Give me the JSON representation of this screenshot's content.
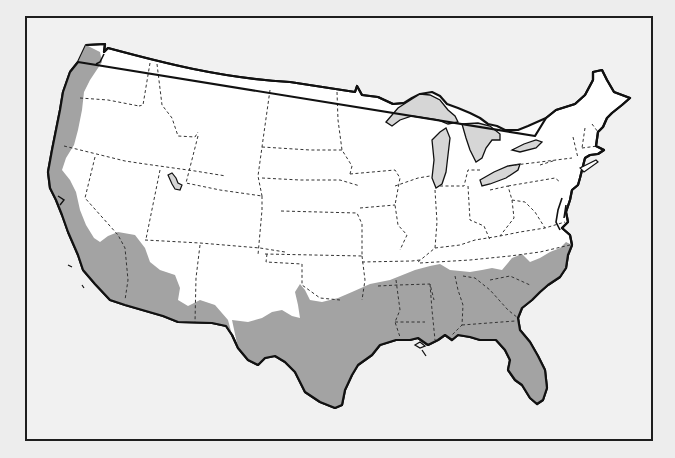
{
  "map": {
    "title": "Contiguous United States with shaded southern and Pacific coastal region",
    "region_label": "Shaded region",
    "colors": {
      "background": "#ededed",
      "frame_fill": "#f1f1f1",
      "frame_border": "#1e1e1e",
      "land": "#ffffff",
      "shaded_region": "#a3a3a3",
      "lakes": "#d6d6d6",
      "coastline": "#111111",
      "state_borders": "#333333"
    },
    "features": [
      "Pacific coast shaded band (Washington, Oregon, California)",
      "Southwest shaded area (southern Arizona)",
      "Southern shaded band (Texas, Louisiana, Mississippi, Alabama, Georgia, Florida, South Carolina, North Carolina)",
      "Great Lakes",
      "Great Salt Lake",
      "Dashed state borders"
    ]
  }
}
